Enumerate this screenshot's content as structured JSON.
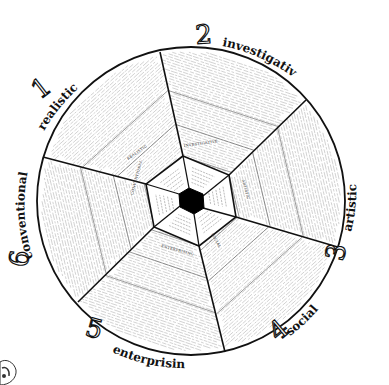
{
  "diagram": {
    "type": "hexagonal-wheel",
    "title": "",
    "center": {
      "x": 191,
      "y": 201
    },
    "outer_radius": 154,
    "colors": {
      "ink": "#111111",
      "background": "#ffffff",
      "fine_text": "#9a9a9a",
      "center_fill": "#000000"
    },
    "sections": [
      {
        "number": "1",
        "name": "realistic",
        "inner_label": "REALISTIC",
        "subheadings": [
          "Activities",
          "Competencies",
          "Occupations"
        ]
      },
      {
        "number": "2",
        "name": "investigative",
        "inner_label": "INVESTIGATIVE",
        "subheadings": [
          "Activities",
          "Competencies",
          "Occupations"
        ]
      },
      {
        "number": "3",
        "name": "artistic",
        "inner_label": "ARTISTIC",
        "subheadings": [
          "Activities",
          "Competencies",
          "Occupations"
        ]
      },
      {
        "number": "4",
        "name": "social",
        "inner_label": "SOCIAL",
        "subheadings": [
          "Activities",
          "Competencies",
          "Occupations"
        ]
      },
      {
        "number": "5",
        "name": "enterprising",
        "inner_label": "ENTERPRISING",
        "subheadings": [
          "Activities",
          "Competencies",
          "Occupations"
        ]
      },
      {
        "number": "6",
        "name": "conventional",
        "inner_label": "CONVENTIONAL",
        "subheadings": [
          "Activities",
          "Competencies",
          "Occupations"
        ]
      }
    ]
  }
}
